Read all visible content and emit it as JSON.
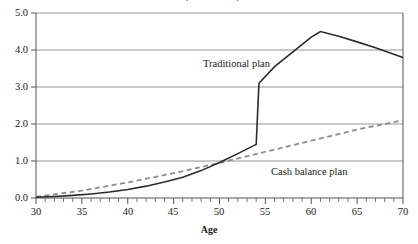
{
  "chart_data": {
    "type": "line",
    "title": "",
    "xlabel": "Age",
    "ylabel": "",
    "xlim": [
      30,
      70
    ],
    "ylim": [
      0.0,
      5.0
    ],
    "grid": true,
    "grid_axis": "y",
    "legend_position": "inline-annotations",
    "x_ticks": [
      30,
      35,
      40,
      45,
      50,
      55,
      60,
      65,
      70
    ],
    "x_tick_labels": [
      "30",
      "35",
      "40",
      "45",
      "50",
      "55",
      "60",
      "65",
      "70"
    ],
    "x_minor_tick_step": 1,
    "y_ticks": [
      0.0,
      1.0,
      2.0,
      3.0,
      4.0,
      5.0
    ],
    "y_tick_labels": [
      "0.0",
      "1.0",
      "2.0",
      "3.0",
      "4.0",
      "5.0"
    ],
    "series": [
      {
        "name": "Traditional plan",
        "style": "solid",
        "color": "#2b2b2b",
        "annotation_label": "Traditional plan",
        "x": [
          30,
          32,
          34,
          36,
          38,
          40,
          42,
          44,
          46,
          48,
          50,
          52,
          54,
          54.3,
          56,
          58,
          60,
          61,
          63,
          65,
          67,
          70
        ],
        "y": [
          0.02,
          0.04,
          0.07,
          0.11,
          0.16,
          0.23,
          0.32,
          0.43,
          0.56,
          0.74,
          0.96,
          1.2,
          1.45,
          3.1,
          3.55,
          3.95,
          4.35,
          4.5,
          4.37,
          4.22,
          4.06,
          3.8
        ]
      },
      {
        "name": "Cash balance plan",
        "style": "dashed",
        "color": "#8c8c8c",
        "annotation_label": "Cash balance plan",
        "x": [
          30,
          35,
          40,
          45,
          50,
          55,
          60,
          65,
          70
        ],
        "y": [
          0.03,
          0.2,
          0.42,
          0.67,
          0.95,
          1.25,
          1.55,
          1.85,
          2.1
        ]
      }
    ],
    "annotations": [
      {
        "text": "Traditional plan",
        "x": 55.5,
        "y": 3.65
      },
      {
        "text": "Cash balance plan",
        "x": 58.5,
        "y": 0.9
      }
    ]
  },
  "axis_title": "Age",
  "ytick_labels": [
    "5.0",
    "4.0",
    "3.0",
    "2.0",
    "1.0",
    "0.0"
  ],
  "xtick_labels": [
    "30",
    "35",
    "40",
    "45",
    "50",
    "55",
    "60",
    "65",
    "70"
  ],
  "annotations": {
    "traditional": "Traditional plan",
    "cash_balance": "Cash balance plan"
  },
  "title_clipped": "Accrual pattern comparison"
}
